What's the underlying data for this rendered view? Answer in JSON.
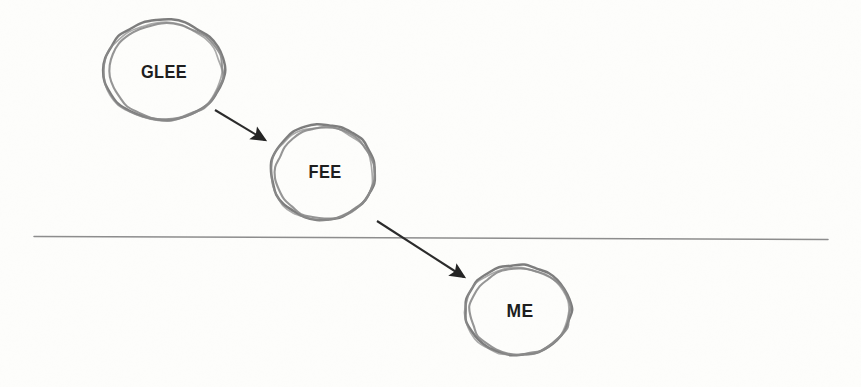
{
  "document": {
    "kind": "hand-drawn-diagram",
    "background_color": "#fdfdfb",
    "width": 861,
    "height": 387
  },
  "palette": {
    "circle_stroke": "#8a8a8a",
    "circle_stroke_dark": "#767676",
    "arrow_color": "#2b2b2b",
    "baseline_color": "#8d8d8d",
    "label_color": "#1e1e1e"
  },
  "nodes": [
    {
      "id": "glee",
      "label": "GLEE",
      "cx": 164,
      "cy": 70,
      "rx": 60,
      "ry": 50,
      "label_x": 164,
      "label_y": 72
    },
    {
      "id": "fee",
      "label": "FEE",
      "cx": 323,
      "cy": 172,
      "rx": 52,
      "ry": 48,
      "label_x": 325,
      "label_y": 172
    },
    {
      "id": "me",
      "label": "ME",
      "cx": 518,
      "cy": 310,
      "rx": 53,
      "ry": 45,
      "label_x": 520,
      "label_y": 311
    }
  ],
  "arrows": [
    {
      "id": "glee-to-fee",
      "from": "glee",
      "to": "fee",
      "x1": 215,
      "y1": 110,
      "x2": 265,
      "y2": 140
    },
    {
      "id": "fee-to-me",
      "from": "fee",
      "to": "me",
      "x1": 377,
      "y1": 221,
      "x2": 464,
      "y2": 277
    }
  ],
  "baseline": {
    "id": "horizontal-rule",
    "x1": 34,
    "y1": 236.5,
    "x2": 828,
    "y2": 239.5
  }
}
